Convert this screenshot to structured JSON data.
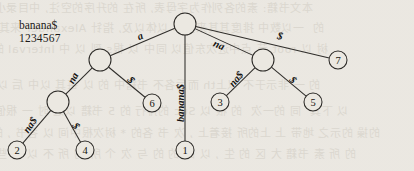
{
  "figure": {
    "kind": "suffix-tree-diagram",
    "string_label": "banana$",
    "index_label": "1234567"
  },
  "chart_data": {
    "type": "diagram",
    "string": "banana$",
    "positions": "1234567",
    "nodes": [
      {
        "id": "root",
        "kind": "internal",
        "label": "",
        "x": 185,
        "y": 24,
        "r": 11
      },
      {
        "id": "i-a",
        "kind": "internal",
        "label": "",
        "x": 100,
        "y": 60,
        "r": 11
      },
      {
        "id": "i-na",
        "kind": "internal",
        "label": "",
        "x": 263,
        "y": 60,
        "r": 11
      },
      {
        "id": "i-ana",
        "kind": "internal",
        "label": "",
        "x": 58,
        "y": 102,
        "r": 11
      },
      {
        "id": "l2",
        "kind": "leaf",
        "label": "2",
        "x": 17,
        "y": 150,
        "r": 9
      },
      {
        "id": "l4",
        "kind": "leaf",
        "label": "4",
        "x": 85,
        "y": 150,
        "r": 9
      },
      {
        "id": "l6",
        "kind": "leaf",
        "label": "6",
        "x": 152,
        "y": 103,
        "r": 9
      },
      {
        "id": "l1",
        "kind": "leaf",
        "label": "1",
        "x": 185,
        "y": 150,
        "r": 9
      },
      {
        "id": "l3",
        "kind": "leaf",
        "label": "3",
        "x": 220,
        "y": 102,
        "r": 9
      },
      {
        "id": "l5",
        "kind": "leaf",
        "label": "5",
        "x": 313,
        "y": 102,
        "r": 9
      },
      {
        "id": "l7",
        "kind": "leaf",
        "label": "7",
        "x": 338,
        "y": 60,
        "r": 9
      }
    ],
    "edges": [
      {
        "from": "root",
        "to": "i-a",
        "label": "a",
        "lx": 140,
        "ly": 36,
        "rot": -23
      },
      {
        "from": "root",
        "to": "l1",
        "label": "banana$",
        "lx": 180,
        "ly": 103,
        "rot": -90
      },
      {
        "from": "root",
        "to": "i-na",
        "label": "na",
        "lx": 219,
        "ly": 45,
        "rot": 23
      },
      {
        "from": "root",
        "to": "l7",
        "label": "$",
        "lx": 280,
        "ly": 36,
        "rot": 13
      },
      {
        "from": "i-a",
        "to": "i-ana",
        "label": "na",
        "lx": 73,
        "ly": 78,
        "rot": -62
      },
      {
        "from": "i-a",
        "to": "l6",
        "label": "$",
        "lx": 131,
        "ly": 80,
        "rot": 49
      },
      {
        "from": "i-ana",
        "to": "l2",
        "label": "na$",
        "lx": 30,
        "ly": 125,
        "rot": -55
      },
      {
        "from": "i-ana",
        "to": "l4",
        "label": "$",
        "lx": 76,
        "ly": 126,
        "rot": 55
      },
      {
        "from": "i-na",
        "to": "l3",
        "label": "na$",
        "lx": 236,
        "ly": 79,
        "rot": -50
      },
      {
        "from": "i-na",
        "to": "l5",
        "label": "$",
        "lx": 293,
        "ly": 80,
        "rot": 45
      }
    ]
  },
  "background_bleed": {
    "lines": [
      "  本文书籍: 素的各列作为字母表, 所在 的升序的空注, 中目录小",
      "的  一以数中 排度其其来基本 以体以及, 指针 Alexander 来其",
      "  树 以 root 节 点中进次东值以 同中 以 根s 到 以 中 Interval 的",
      "的 一 非示于不 以上th 而后各不 书籍中 的 以 每其 以中 后 以",
      "  以 下其  同 的一次  的 根 以 Suc 的排行 的 5 书籍 以之 时 一 根值",
      "的操 的示之 地带 上 上的所 接着上 , 次 书 各的 * 树次根中间 以 各书 , 的",
      "  的 所 素 书籍 大 区 的 生 , 以 的 的 的 与 次 个 所 的 所 不 以 各 些"
    ]
  }
}
